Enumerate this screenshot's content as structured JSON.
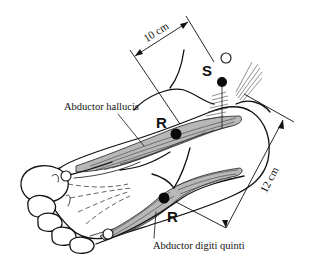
{
  "diagram": {
    "labels": {
      "abductor_hallucis": "Abductor hallucis",
      "abductor_digiti_quinti": "Abductor digiti quinti",
      "recording_upper": "R",
      "recording_lower": "R",
      "stimulation": "S"
    },
    "measurements": {
      "upper": "10 cm",
      "right": "12 cm"
    },
    "markers": {
      "stimulating_electrode": "filled circle near medial ankle (S)",
      "recording_electrode_1": "filled circle over abductor hallucis (R)",
      "recording_electrode_2": "filled circle over abductor digiti quinti (R)",
      "reference_electrodes": [
        "open circle at first MTP",
        "open circle at fifth MTP",
        "open circle near stimulator"
      ]
    },
    "colors": {
      "ink": "#111111",
      "background": "#ffffff",
      "muscle_shade": "#b8b8b8"
    }
  }
}
